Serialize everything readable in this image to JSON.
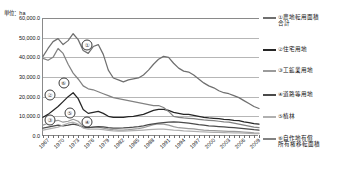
{
  "unit_label": "単位：ha",
  "axis": {
    "y_ticks": [
      "60,000.0",
      "50,000.0",
      "40,000.0",
      "30,000.0",
      "20,000.0",
      "10,000.0",
      "0.0"
    ],
    "y_tick_values": [
      60000,
      50000,
      40000,
      30000,
      20000,
      10000,
      0
    ],
    "x_ticks": [
      "1967",
      "1970",
      "1973",
      "1976",
      "1979",
      "1982",
      "1985",
      "1988",
      "1991",
      "1994",
      "1997",
      "2000",
      "2003",
      "2006",
      "2009"
    ]
  },
  "legend": {
    "items": [
      {
        "marker": "①",
        "label": "①農地転用面積\n合計",
        "color": "#6f6f6f"
      },
      {
        "marker": "②",
        "label": "②住宅用地",
        "color": "#262626"
      },
      {
        "marker": "③",
        "label": "③工鉱業用地",
        "color": "#9b9b9b"
      },
      {
        "marker": "④",
        "label": "④道路等用地",
        "color": "#4a4a4a"
      },
      {
        "marker": "⑤",
        "label": "⑤植林",
        "color": "#b0b0b0"
      },
      {
        "marker": "⑥",
        "label": "⑥自作地有償\n所有権移転面積",
        "color": "#828282"
      }
    ]
  },
  "plot_markers": [
    {
      "id": "marker-1",
      "text": "①",
      "x": 0.205,
      "y": 0.232
    },
    {
      "id": "marker-2",
      "text": "②",
      "x": 0.033,
      "y": 0.652
    },
    {
      "id": "marker-3",
      "text": "③",
      "x": 0.033,
      "y": 0.862
    },
    {
      "id": "marker-4",
      "text": "④",
      "x": 0.205,
      "y": 0.878
    },
    {
      "id": "marker-5",
      "text": "⑤",
      "x": 0.124,
      "y": 0.805
    },
    {
      "id": "marker-6",
      "text": "⑥",
      "x": 0.095,
      "y": 0.548
    }
  ],
  "chart_data": {
    "type": "line",
    "title": "",
    "subtitle": "",
    "xlabel": "",
    "ylabel": "",
    "unit": "ha",
    "ylim": [
      0,
      60000
    ],
    "xlim": [
      1967,
      2010
    ],
    "grid": true,
    "legend_position": "right",
    "x": [
      1967,
      1968,
      1969,
      1970,
      1971,
      1972,
      1973,
      1974,
      1975,
      1976,
      1977,
      1978,
      1979,
      1980,
      1981,
      1982,
      1983,
      1984,
      1985,
      1986,
      1987,
      1988,
      1989,
      1990,
      1991,
      1992,
      1993,
      1994,
      1995,
      1996,
      1997,
      1998,
      1999,
      2000,
      2001,
      2002,
      2003,
      2004,
      2005,
      2006,
      2007,
      2008,
      2009,
      2010
    ],
    "series": [
      {
        "name": "①農地転用面積合計",
        "color": "#6f6f6f",
        "values": [
          40500,
          44500,
          48000,
          49500,
          46500,
          48500,
          52000,
          49000,
          43500,
          42000,
          45500,
          46500,
          41500,
          33500,
          29500,
          28500,
          27500,
          28500,
          29000,
          29500,
          31000,
          33500,
          36500,
          39000,
          40500,
          40000,
          37000,
          34500,
          33000,
          32500,
          31000,
          29000,
          27000,
          25500,
          24500,
          23000,
          22000,
          21500,
          20500,
          19500,
          18000,
          16500,
          15000,
          14000
        ]
      },
      {
        "name": "②住宅用地",
        "color": "#262626",
        "values": [
          9500,
          11000,
          13000,
          15000,
          17500,
          20000,
          22000,
          19000,
          13500,
          11500,
          12000,
          12500,
          11500,
          10000,
          9500,
          9500,
          9500,
          9800,
          10000,
          10500,
          11000,
          12000,
          13000,
          13500,
          13500,
          13000,
          12000,
          11500,
          11000,
          11000,
          10500,
          10000,
          9500,
          9200,
          9000,
          8800,
          8500,
          8300,
          8000,
          7800,
          7200,
          6800,
          6300,
          6000
        ]
      },
      {
        "name": "③工鉱業用地",
        "color": "#9b9b9b",
        "values": [
          5500,
          6500,
          7500,
          8000,
          7000,
          7500,
          8500,
          7500,
          5000,
          4200,
          4500,
          4500,
          4000,
          3500,
          3200,
          3000,
          3000,
          3200,
          3500,
          3800,
          4200,
          5000,
          5800,
          6200,
          6000,
          5500,
          4800,
          4200,
          4000,
          3800,
          3600,
          3300,
          3000,
          2800,
          2700,
          2600,
          2500,
          2400,
          2300,
          2200,
          2000,
          1800,
          1600,
          1500
        ]
      },
      {
        "name": "④道路等用地",
        "color": "#4a4a4a",
        "values": [
          4000,
          4500,
          5000,
          5500,
          5200,
          5500,
          6000,
          5500,
          4500,
          4200,
          4500,
          4800,
          4600,
          4200,
          4000,
          4000,
          4100,
          4300,
          4500,
          4800,
          5200,
          5800,
          6200,
          6500,
          6800,
          7000,
          7200,
          7000,
          6800,
          6500,
          6200,
          5800,
          5500,
          5200,
          5000,
          4800,
          4600,
          4400,
          4200,
          4000,
          3800,
          3500,
          3200,
          3000
        ]
      },
      {
        "name": "⑤植林",
        "color": "#b0b0b0",
        "values": [
          3000,
          3500,
          4000,
          4500,
          5500,
          6500,
          7000,
          6000,
          4000,
          3500,
          3500,
          3500,
          3200,
          2800,
          2600,
          2500,
          2500,
          2600,
          2700,
          2800,
          3000,
          3200,
          3400,
          3500,
          3500,
          3300,
          3000,
          2800,
          2600,
          2500,
          2400,
          2200,
          2100,
          2000,
          1900,
          1800,
          1700,
          1650,
          1600,
          1550,
          1450,
          1350,
          1250,
          1200
        ]
      },
      {
        "name": "⑥自作地有償所有権移転面積",
        "color": "#828282",
        "values": [
          39500,
          38500,
          40000,
          44500,
          42000,
          36500,
          32000,
          29000,
          25500,
          24000,
          23500,
          22500,
          21500,
          20500,
          19500,
          19000,
          18500,
          18000,
          17500,
          17000,
          16500,
          16000,
          15500,
          15500,
          14500,
          12500,
          10000,
          9500,
          9200,
          9000,
          8800,
          8500,
          8200,
          8000,
          7800,
          7500,
          7200,
          7000,
          6500,
          6000,
          5500,
          5000,
          4500,
          4200
        ]
      }
    ]
  }
}
